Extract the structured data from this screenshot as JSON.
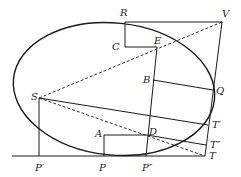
{
  "diagram": {
    "points": {
      "R": {
        "label": "R",
        "x": 125,
        "y": 22
      },
      "V": {
        "label": "V",
        "x": 222,
        "y": 22
      },
      "C": {
        "label": "C",
        "x": 125,
        "y": 47
      },
      "E": {
        "label": "E",
        "x": 157,
        "y": 48
      },
      "B": {
        "label": "B",
        "x": 153,
        "y": 80
      },
      "Q": {
        "label": "Q",
        "x": 213,
        "y": 90
      },
      "S": {
        "label": "S",
        "x": 39,
        "y": 98
      },
      "T1": {
        "label": "T′",
        "x": 208,
        "y": 125
      },
      "A": {
        "label": "A",
        "x": 104,
        "y": 136
      },
      "D": {
        "label": "D",
        "x": 147,
        "y": 136
      },
      "T2": {
        "label": "T″",
        "x": 206,
        "y": 145
      },
      "T": {
        "label": "T",
        "x": 205,
        "y": 156
      },
      "P1": {
        "label": "P′",
        "x": 39,
        "y": 156
      },
      "P": {
        "label": "P",
        "x": 104,
        "y": 156
      },
      "P2": {
        "label": "P″",
        "x": 146,
        "y": 156
      }
    },
    "colors": {
      "stroke": "#1a1a1a",
      "background": "#ffffff"
    }
  }
}
